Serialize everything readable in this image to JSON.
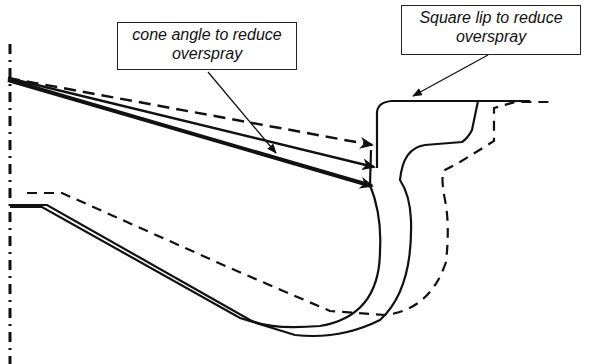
{
  "callouts": {
    "cone_angle": {
      "line1": "cone angle to reduce",
      "line2": "overspray"
    },
    "square_lip": {
      "line1": "Square lip to reduce",
      "line2": "overspray"
    }
  },
  "legend": {
    "solid_line": "modified profile",
    "dashed_line": "original profile",
    "dash_dot_line": "centerline axis"
  },
  "colors": {
    "stroke": "#111111",
    "background": "#ffffff"
  }
}
